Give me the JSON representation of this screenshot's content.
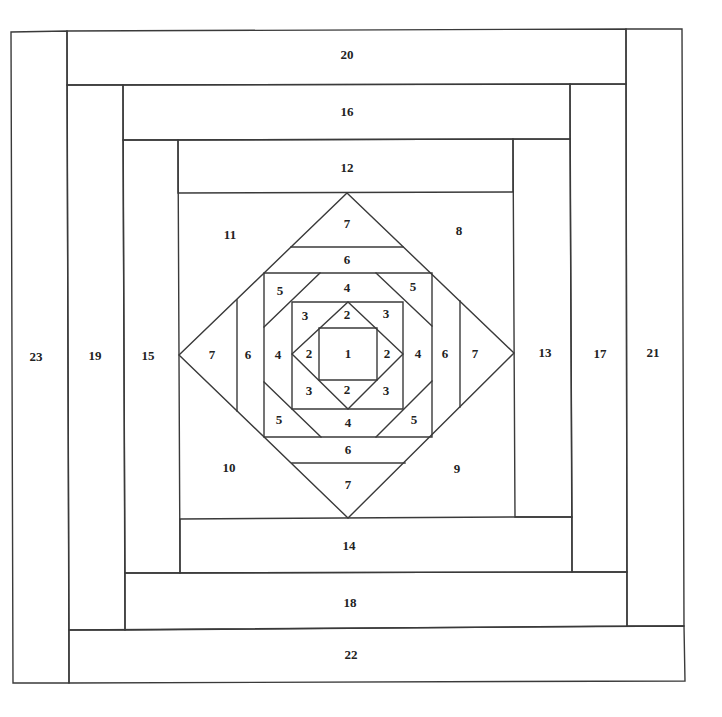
{
  "diagram": {
    "type": "quilt-block-foundation-piecing-pattern",
    "line_color": "#3a3a3a",
    "background": "#ffffff",
    "labels": [
      {
        "id": "p1",
        "text": "1",
        "x": 348,
        "y": 355
      },
      {
        "id": "p2t",
        "text": "2",
        "x": 347,
        "y": 316
      },
      {
        "id": "p2l",
        "text": "2",
        "x": 309,
        "y": 355
      },
      {
        "id": "p2r",
        "text": "2",
        "x": 387,
        "y": 355
      },
      {
        "id": "p2b",
        "text": "2",
        "x": 347,
        "y": 391
      },
      {
        "id": "p3tl",
        "text": "3",
        "x": 305,
        "y": 317
      },
      {
        "id": "p3tr",
        "text": "3",
        "x": 386,
        "y": 315
      },
      {
        "id": "p3bl",
        "text": "3",
        "x": 309,
        "y": 392
      },
      {
        "id": "p3br",
        "text": "3",
        "x": 386,
        "y": 392
      },
      {
        "id": "p4t",
        "text": "4",
        "x": 347,
        "y": 289
      },
      {
        "id": "p4l",
        "text": "4",
        "x": 278,
        "y": 356
      },
      {
        "id": "p4r",
        "text": "4",
        "x": 418,
        "y": 355
      },
      {
        "id": "p4b",
        "text": "4",
        "x": 348,
        "y": 424
      },
      {
        "id": "p5tl",
        "text": "5",
        "x": 280,
        "y": 292
      },
      {
        "id": "p5tr",
        "text": "5",
        "x": 413,
        "y": 288
      },
      {
        "id": "p5bl",
        "text": "5",
        "x": 279,
        "y": 421
      },
      {
        "id": "p5br",
        "text": "5",
        "x": 414,
        "y": 421
      },
      {
        "id": "p6t",
        "text": "6",
        "x": 347,
        "y": 261
      },
      {
        "id": "p6l",
        "text": "6",
        "x": 248,
        "y": 356
      },
      {
        "id": "p6r",
        "text": "6",
        "x": 445,
        "y": 355
      },
      {
        "id": "p6b",
        "text": "6",
        "x": 348,
        "y": 451
      },
      {
        "id": "p7t",
        "text": "7",
        "x": 347,
        "y": 225
      },
      {
        "id": "p7l",
        "text": "7",
        "x": 212,
        "y": 356
      },
      {
        "id": "p7r",
        "text": "7",
        "x": 475,
        "y": 355
      },
      {
        "id": "p7b",
        "text": "7",
        "x": 348,
        "y": 486
      },
      {
        "id": "p8",
        "text": "8",
        "x": 459,
        "y": 232
      },
      {
        "id": "p9",
        "text": "9",
        "x": 457,
        "y": 470
      },
      {
        "id": "p10",
        "text": "10",
        "x": 229,
        "y": 469
      },
      {
        "id": "p11",
        "text": "11",
        "x": 230,
        "y": 236
      },
      {
        "id": "p12",
        "text": "12",
        "x": 347,
        "y": 169
      },
      {
        "id": "p13",
        "text": "13",
        "x": 545,
        "y": 354
      },
      {
        "id": "p14",
        "text": "14",
        "x": 349,
        "y": 547
      },
      {
        "id": "p15",
        "text": "15",
        "x": 148,
        "y": 357
      },
      {
        "id": "p16",
        "text": "16",
        "x": 347,
        "y": 113
      },
      {
        "id": "p17",
        "text": "17",
        "x": 600,
        "y": 355
      },
      {
        "id": "p18",
        "text": "18",
        "x": 350,
        "y": 604
      },
      {
        "id": "p19",
        "text": "19",
        "x": 95,
        "y": 357
      },
      {
        "id": "p20",
        "text": "20",
        "x": 347,
        "y": 56
      },
      {
        "id": "p21",
        "text": "21",
        "x": 653,
        "y": 354
      },
      {
        "id": "p22",
        "text": "22",
        "x": 351,
        "y": 656
      },
      {
        "id": "p23",
        "text": "23",
        "x": 36,
        "y": 358
      }
    ]
  }
}
